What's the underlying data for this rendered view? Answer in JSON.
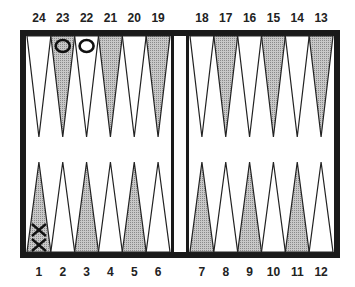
{
  "colors": {
    "frame": "#1a1a1a",
    "dark_point": "#bdbdbd",
    "light_point": "#ffffff",
    "outline": "#222222",
    "board": "#ffffff"
  },
  "top_points": [
    {
      "number": "24",
      "shade": "light"
    },
    {
      "number": "23",
      "shade": "dark"
    },
    {
      "number": "22",
      "shade": "light"
    },
    {
      "number": "21",
      "shade": "dark"
    },
    {
      "number": "20",
      "shade": "light"
    },
    {
      "number": "19",
      "shade": "dark"
    },
    {
      "number": "18",
      "shade": "light"
    },
    {
      "number": "17",
      "shade": "dark"
    },
    {
      "number": "16",
      "shade": "light"
    },
    {
      "number": "15",
      "shade": "dark"
    },
    {
      "number": "14",
      "shade": "light"
    },
    {
      "number": "13",
      "shade": "dark"
    }
  ],
  "bottom_points": [
    {
      "number": "1",
      "shade": "dark"
    },
    {
      "number": "2",
      "shade": "light"
    },
    {
      "number": "3",
      "shade": "dark"
    },
    {
      "number": "4",
      "shade": "light"
    },
    {
      "number": "5",
      "shade": "dark"
    },
    {
      "number": "6",
      "shade": "light"
    },
    {
      "number": "7",
      "shade": "dark"
    },
    {
      "number": "8",
      "shade": "light"
    },
    {
      "number": "9",
      "shade": "dark"
    },
    {
      "number": "10",
      "shade": "light"
    },
    {
      "number": "11",
      "shade": "dark"
    },
    {
      "number": "12",
      "shade": "light"
    }
  ],
  "checkers": [
    {
      "point": "23",
      "symbol": "O",
      "count": 1
    },
    {
      "point": "22",
      "symbol": "O",
      "count": 1
    },
    {
      "point": "1",
      "symbol": "X",
      "count": 2
    }
  ]
}
